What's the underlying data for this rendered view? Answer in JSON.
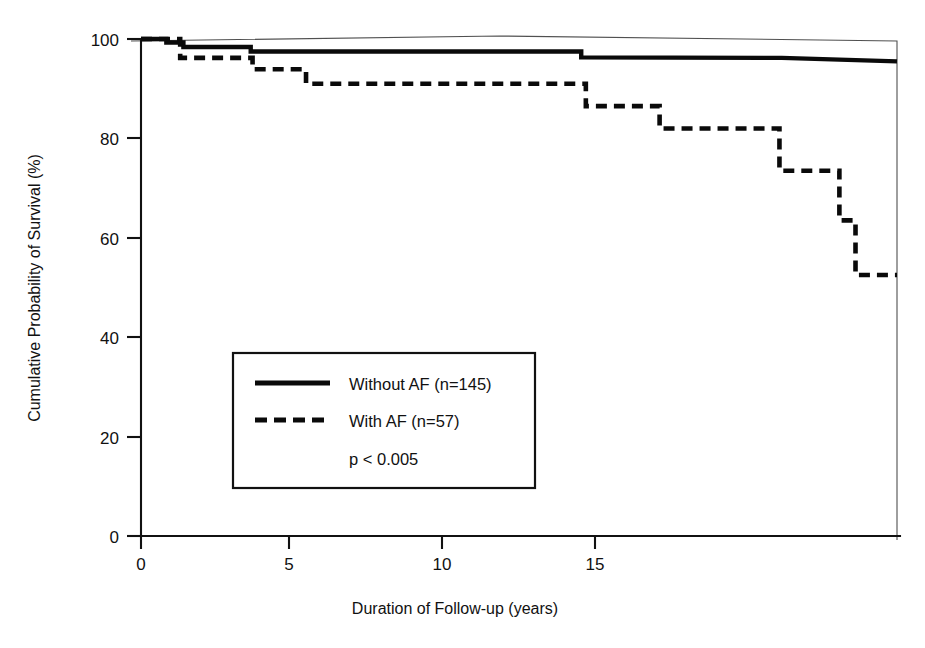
{
  "chart_data": {
    "type": "line",
    "subtype": "kaplan-meier-survival-step",
    "title": "",
    "xlabel": "Duration of Follow-up (years)",
    "ylabel": "Cumulative Probability of Survival (%)",
    "xlim": [
      0,
      16.4
    ],
    "ylim": [
      0,
      100
    ],
    "xticks": [
      0,
      5,
      10,
      15
    ],
    "xtick_labels": [
      "0",
      "5",
      "10",
      "15"
    ],
    "yticks": [
      0,
      20,
      40,
      60,
      80,
      100
    ],
    "ytick_labels": [
      "0",
      "20",
      "40",
      "60",
      "80",
      "100"
    ],
    "grid": false,
    "legend_position": "center-left-inside",
    "annotations": [
      "p < 0.005"
    ],
    "series": [
      {
        "name": "Without AF (n=145)",
        "n": 145,
        "style": "solid",
        "color": "#0a0a0a",
        "points": [
          [
            0.0,
            100.0
          ],
          [
            0.55,
            100.0
          ],
          [
            0.55,
            99.3
          ],
          [
            0.92,
            99.3
          ],
          [
            0.92,
            98.4
          ],
          [
            2.38,
            98.4
          ],
          [
            2.38,
            97.5
          ],
          [
            9.55,
            97.5
          ],
          [
            9.55,
            96.3
          ],
          [
            13.9,
            96.2
          ],
          [
            16.4,
            95.5
          ]
        ]
      },
      {
        "name": "With AF (n=57)",
        "n": 57,
        "style": "dashed",
        "color": "#0a0a0a",
        "points": [
          [
            0.0,
            100.0
          ],
          [
            0.85,
            100.0
          ],
          [
            0.85,
            96.2
          ],
          [
            2.42,
            96.2
          ],
          [
            2.42,
            93.9
          ],
          [
            3.58,
            93.9
          ],
          [
            3.58,
            91.0
          ],
          [
            9.65,
            91.0
          ],
          [
            9.65,
            86.5
          ],
          [
            11.25,
            86.5
          ],
          [
            11.25,
            82.0
          ],
          [
            13.85,
            82.0
          ],
          [
            13.85,
            73.5
          ],
          [
            15.15,
            73.5
          ],
          [
            15.15,
            63.5
          ],
          [
            15.5,
            63.5
          ],
          [
            15.5,
            52.5
          ],
          [
            16.4,
            52.5
          ]
        ]
      }
    ]
  },
  "legend": {
    "entries": [
      {
        "label": "Without AF (n=145)",
        "style": "solid"
      },
      {
        "label": "With AF (n=57)",
        "style": "dashed"
      }
    ],
    "pvalue": "p < 0.005"
  }
}
